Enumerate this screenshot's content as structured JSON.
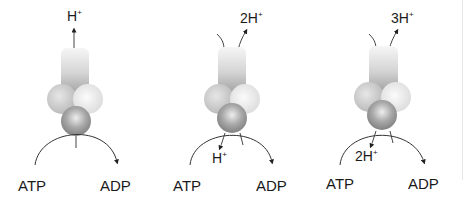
{
  "diagram": {
    "panels": [
      {
        "id": "panel-1",
        "top_ion": "H",
        "top_ion_charge": "+",
        "bottom_ion": "",
        "bottom_ion_charge": "",
        "substrate": "ATP",
        "product": "ADP"
      },
      {
        "id": "panel-2",
        "top_ion": "2H",
        "top_ion_charge": "+",
        "bottom_ion": "H",
        "bottom_ion_charge": "+",
        "substrate": "ATP",
        "product": "ADP"
      },
      {
        "id": "panel-3",
        "top_ion": "3H",
        "top_ion_charge": "+",
        "bottom_ion": "2H",
        "bottom_ion_charge": "+",
        "substrate": "ATP",
        "product": "ADP"
      }
    ],
    "colors": {
      "stalk_light": "#f4f4f4",
      "stalk_dark": "#9a9a9a",
      "sphere_left": "#c8c8c8",
      "sphere_right": "#ececec",
      "sphere_bottom": "#8c8c8c",
      "line": "#333333"
    }
  }
}
